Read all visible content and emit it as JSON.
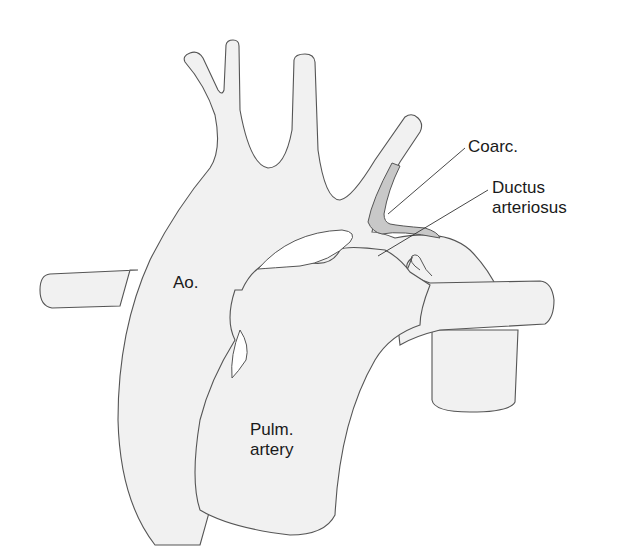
{
  "diagram": {
    "labels": {
      "coarctation": "Coarc.",
      "ductus_line1": "Ductus",
      "ductus_line2": "arteriosus",
      "aorta": "Ao.",
      "pulm_line1": "Pulm.",
      "pulm_line2": "artery"
    },
    "colors": {
      "vessel_fill": "#f1f1f1",
      "vessel_stroke": "#555555",
      "wall": "#b8b8b8",
      "coarctation_fill": "#c8c8c8",
      "background": "#ffffff"
    }
  }
}
